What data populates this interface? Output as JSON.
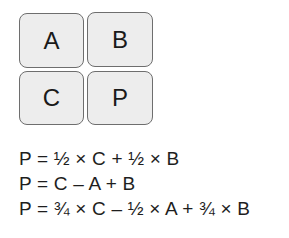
{
  "grid": {
    "cells": [
      {
        "id": "A",
        "label": "A",
        "position": "top-left"
      },
      {
        "id": "B",
        "label": "B",
        "position": "top-right"
      },
      {
        "id": "C",
        "label": "C",
        "position": "bottom-left"
      },
      {
        "id": "P",
        "label": "P",
        "position": "bottom-right"
      }
    ]
  },
  "formulas": [
    "P = ½ × C + ½ × B",
    "P = C – A + B",
    "P = ¾ × C – ½ × A + ¾ × B"
  ],
  "colors": {
    "box_fill": "#ededed",
    "box_border": "#6e6e6e",
    "text": "#1a1a1a"
  }
}
